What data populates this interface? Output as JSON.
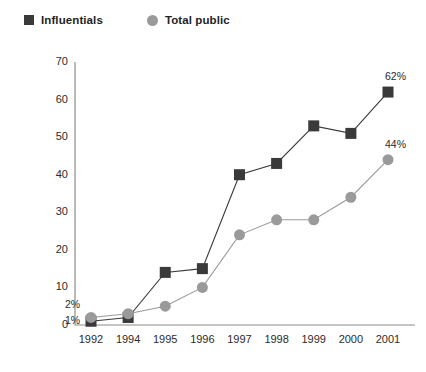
{
  "legend": {
    "position": "top-left",
    "items": [
      {
        "label": "Influentials",
        "marker": "square-marker",
        "color": "#3a3a3a"
      },
      {
        "label": "Total public",
        "marker": "circle-marker",
        "color": "#9a9a9a"
      }
    ]
  },
  "colors": {
    "influentials": "#3a3a3a",
    "total_public": "#9a9a9a",
    "axis": "#8c8c8c",
    "text": "#2b2b2b",
    "background": "#ffffff"
  },
  "chart_data": {
    "type": "line",
    "title": "",
    "xlabel": "",
    "ylabel": "",
    "categories": [
      "1992",
      "1994",
      "1995",
      "1996",
      "1997",
      "1998",
      "1999",
      "2000",
      "2001"
    ],
    "yticks": [
      0,
      10,
      20,
      30,
      40,
      50,
      60,
      70
    ],
    "ylim": [
      0,
      70
    ],
    "grid": false,
    "legend_position": "top-left",
    "series": [
      {
        "name": "Influentials",
        "marker": "square",
        "color": "#3a3a3a",
        "values": [
          1,
          2,
          14,
          15,
          40,
          43,
          53,
          51,
          62
        ]
      },
      {
        "name": "Total public",
        "marker": "circle",
        "color": "#9a9a9a",
        "values": [
          2,
          3,
          5,
          10,
          24,
          28,
          28,
          34,
          44
        ]
      }
    ],
    "annotations": [
      {
        "text": "1%",
        "series": "Influentials",
        "category": "1992",
        "value": 1
      },
      {
        "text": "2%",
        "series": "Total public",
        "category": "1992",
        "value": 2
      },
      {
        "text": "62%",
        "series": "Influentials",
        "category": "2001",
        "value": 62
      },
      {
        "text": "44%",
        "series": "Total public",
        "category": "2001",
        "value": 44
      }
    ]
  }
}
